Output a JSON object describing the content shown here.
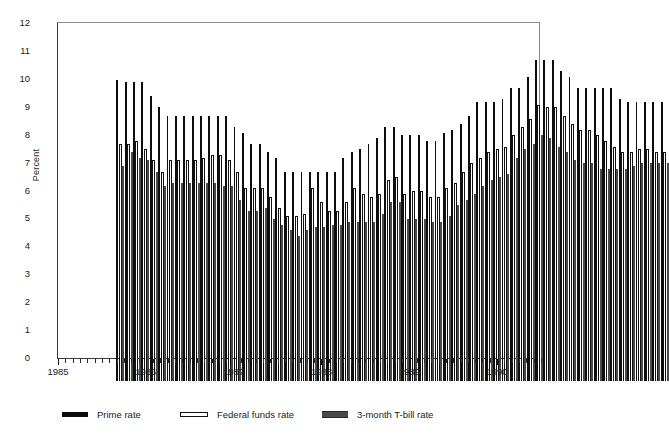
{
  "chart_data": {
    "type": "bar",
    "title": "",
    "xlabel": "",
    "ylabel": "Percent",
    "ylim": [
      0,
      12
    ],
    "yticks": [
      0,
      1,
      2,
      3,
      4,
      5,
      6,
      7,
      8,
      9,
      10,
      11,
      12
    ],
    "grid": false,
    "legend_position": "bottom",
    "x_tick_labels": [
      "1985",
      "1986",
      "1987",
      "1988",
      "1989",
      "1990"
    ],
    "x_tick_label_positions": [
      0,
      12,
      24,
      36,
      48,
      60
    ],
    "x_minor_ticks": "monthly",
    "categories": [
      "1985-01",
      "1985-02",
      "1985-03",
      "1985-04",
      "1985-05",
      "1985-06",
      "1985-07",
      "1985-08",
      "1985-09",
      "1985-10",
      "1985-11",
      "1985-12",
      "1986-01",
      "1986-02",
      "1986-03",
      "1986-04",
      "1986-05",
      "1986-06",
      "1986-07",
      "1986-08",
      "1986-09",
      "1986-10",
      "1986-11",
      "1986-12",
      "1987-01",
      "1987-02",
      "1987-03",
      "1987-04",
      "1987-05",
      "1987-06",
      "1987-07",
      "1987-08",
      "1987-09",
      "1987-10",
      "1987-11",
      "1987-12",
      "1988-01",
      "1988-02",
      "1988-03",
      "1988-04",
      "1988-05",
      "1988-06",
      "1988-07",
      "1988-08",
      "1988-09",
      "1988-10",
      "1988-11",
      "1988-12",
      "1989-01",
      "1989-02",
      "1989-03",
      "1989-04",
      "1989-05",
      "1989-06",
      "1989-07",
      "1989-08",
      "1989-09",
      "1989-10",
      "1989-11",
      "1989-12",
      "1990-01",
      "1990-02",
      "1990-03",
      "1990-04",
      "1990-05",
      "1990-06"
    ],
    "series": [
      {
        "name": "Prime rate",
        "color": "#0d0d0d",
        "values": [
          10.8,
          10.7,
          10.7,
          10.7,
          10.2,
          9.8,
          9.5,
          9.5,
          9.5,
          9.5,
          9.5,
          9.5,
          9.5,
          9.5,
          9.1,
          8.9,
          8.5,
          8.5,
          8.2,
          8.0,
          7.5,
          7.5,
          7.5,
          7.5,
          7.5,
          7.5,
          7.5,
          8.0,
          8.2,
          8.3,
          8.5,
          8.7,
          9.1,
          9.1,
          8.8,
          8.8,
          8.8,
          8.6,
          8.6,
          8.9,
          9.0,
          9.2,
          9.5,
          10.0,
          10.0,
          10.0,
          10.1,
          10.5,
          10.5,
          10.9,
          11.5,
          11.5,
          11.5,
          11.1,
          10.9,
          10.5,
          10.5,
          10.5,
          10.5,
          10.5,
          10.1,
          10.0,
          10.0,
          10.0,
          10.0,
          10.0
        ]
      },
      {
        "name": "Federal funds rate",
        "color": "#ffffff",
        "values": [
          8.5,
          8.5,
          8.6,
          8.3,
          7.9,
          7.5,
          7.9,
          7.9,
          7.9,
          7.9,
          8.0,
          8.1,
          8.1,
          7.9,
          7.5,
          6.9,
          6.9,
          6.9,
          6.6,
          6.2,
          5.9,
          5.9,
          6.0,
          6.9,
          6.4,
          6.1,
          6.1,
          6.4,
          6.9,
          6.7,
          6.6,
          6.7,
          7.2,
          7.3,
          6.7,
          6.8,
          6.8,
          6.6,
          6.6,
          6.9,
          7.1,
          7.5,
          7.8,
          8.0,
          8.2,
          8.3,
          8.4,
          8.8,
          9.1,
          9.4,
          9.9,
          9.8,
          9.8,
          9.5,
          9.2,
          9.0,
          9.0,
          8.8,
          8.6,
          8.4,
          8.2,
          8.2,
          8.3,
          8.3,
          8.2,
          8.2
        ]
      },
      {
        "name": "3-month T-bill rate",
        "color": "#4a4a4a",
        "values": [
          7.7,
          8.2,
          8.0,
          7.9,
          7.5,
          7.0,
          7.1,
          7.1,
          7.1,
          7.1,
          7.1,
          7.1,
          7.0,
          7.0,
          6.5,
          6.1,
          6.1,
          6.2,
          5.8,
          5.6,
          5.4,
          5.2,
          5.4,
          5.5,
          5.5,
          5.6,
          5.6,
          5.7,
          5.7,
          5.7,
          5.7,
          6.0,
          6.4,
          6.4,
          5.8,
          5.8,
          5.8,
          5.7,
          5.7,
          5.9,
          6.3,
          6.5,
          6.7,
          7.0,
          7.2,
          7.3,
          7.4,
          8.0,
          8.3,
          8.5,
          8.8,
          8.7,
          8.4,
          8.2,
          7.9,
          7.8,
          7.8,
          7.6,
          7.6,
          7.6,
          7.6,
          7.7,
          7.8,
          7.8,
          7.8,
          7.8
        ]
      }
    ]
  },
  "axis": {
    "y_title": "Percent",
    "y_labels": [
      "12",
      "11",
      "10",
      "9",
      "8",
      "7",
      "6",
      "5",
      "4",
      "3",
      "2",
      "1",
      "0"
    ],
    "x_labels": [
      "1985",
      "1986",
      "1987",
      "1988",
      "1989",
      "1990"
    ]
  },
  "legend": {
    "items": [
      {
        "label": "Prime rate",
        "swatch": "prime-swatch"
      },
      {
        "label": "Federal funds rate",
        "swatch": "federal-funds-swatch"
      },
      {
        "label": "3-month T-bill rate",
        "swatch": "tbill-swatch"
      }
    ]
  }
}
